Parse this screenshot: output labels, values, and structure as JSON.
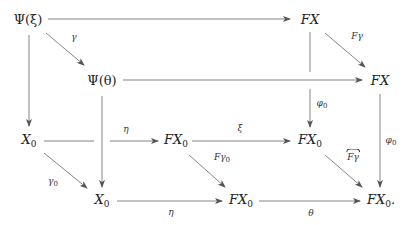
{
  "diagram": {
    "type": "commutative-diagram",
    "nodes": {
      "psi_xi": "Ψ(ξ)",
      "fx_top": "FX",
      "psi_theta": "Ψ(θ)",
      "fx_right": "FX",
      "x0_left": "X0",
      "fx0_midleft": "FX0",
      "fx0_midright": "FX0",
      "x0_bottom": "X0",
      "fx0_bottom": "FX0",
      "fx0_bottomright": "FX0."
    },
    "labels": {
      "gamma": "γ",
      "f_gamma": "Fγ",
      "phi0_mid": "φ0",
      "phi0_right": "φ0",
      "eta_mid": "η",
      "xi": "ξ",
      "f_gamma0": "Fγ0",
      "f_gamma_hat": "Fγ",
      "gamma0": "γ0",
      "eta_bottom": "η",
      "theta": "θ"
    },
    "edges": [
      {
        "from": "psi_xi",
        "to": "fx_top",
        "label": ""
      },
      {
        "from": "psi_xi",
        "to": "psi_theta",
        "label": "gamma"
      },
      {
        "from": "psi_xi",
        "to": "x0_left",
        "label": ""
      },
      {
        "from": "fx_top",
        "to": "fx_right",
        "label": "f_gamma"
      },
      {
        "from": "fx_top",
        "to": "fx0_midright",
        "label": "phi0_mid"
      },
      {
        "from": "psi_theta",
        "to": "fx_right",
        "label": ""
      },
      {
        "from": "psi_theta",
        "to": "x0_bottom",
        "label": ""
      },
      {
        "from": "fx_right",
        "to": "fx0_bottomright",
        "label": "phi0_right"
      },
      {
        "from": "x0_left",
        "to": "fx0_midleft",
        "label": "eta_mid"
      },
      {
        "from": "x0_left",
        "to": "x0_bottom",
        "label": "gamma0"
      },
      {
        "from": "fx0_midleft",
        "to": "fx0_midright",
        "label": "xi"
      },
      {
        "from": "fx0_midleft",
        "to": "fx0_bottom",
        "label": "f_gamma0"
      },
      {
        "from": "fx0_midright",
        "to": "fx0_bottomright",
        "label": "f_gamma_hat"
      },
      {
        "from": "x0_bottom",
        "to": "fx0_bottom",
        "label": "eta_bottom"
      },
      {
        "from": "fx0_bottom",
        "to": "fx0_bottomright",
        "label": "theta"
      }
    ]
  }
}
